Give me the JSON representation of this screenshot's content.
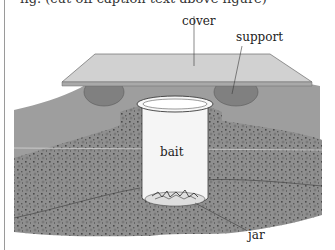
{
  "figure": {
    "clipped_caption": "fig. (cut-off caption text above figure)",
    "labels": {
      "cover": "cover",
      "support": "support",
      "bait": "bait",
      "jar": "jar"
    },
    "colors": {
      "background": "#ffffff",
      "cover_top": "#cfcfcf",
      "cover_edge": "#a8a8a8",
      "soil_surface": "#9c9c9c",
      "soil_speckled": "#8e8e8e",
      "support_stone": "#7f7f7f",
      "jar": "#f4f4f4",
      "outline": "#3a3a3a"
    }
  }
}
